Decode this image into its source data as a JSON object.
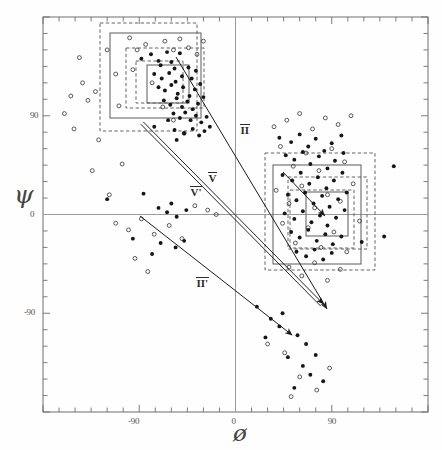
{
  "figure": {
    "kind": "scatter-plot"
  },
  "axes": {
    "x_symbol": "ø",
    "y_symbol": "ψ",
    "x_name": "phi",
    "y_name": "psi",
    "x_ticklabels": [
      "-90",
      "0",
      "90"
    ],
    "y_ticklabels": [
      "90",
      "0",
      "-90"
    ],
    "x_tickvalues": [
      -90,
      0,
      90
    ],
    "y_tickvalues": [
      90,
      0,
      -90
    ],
    "xlim": [
      -180,
      180
    ],
    "ylim": [
      -180,
      180
    ],
    "minor_tick_step": 15,
    "frame_color": "#6e6e6e",
    "zeroline_color": "#9a9a9a"
  },
  "annotations": [
    {
      "id": "label-II",
      "text": "II",
      "overbar": true,
      "x": 240,
      "y": 124
    },
    {
      "id": "label-IIp",
      "text": "II'",
      "overbar": true,
      "x": 196,
      "y": 277
    },
    {
      "id": "label-V",
      "text": "V",
      "overbar": true,
      "x": 208,
      "y": 172
    },
    {
      "id": "label-Vp",
      "text": "V'",
      "overbar": true,
      "x": 190,
      "y": 186
    }
  ],
  "arrows": [
    {
      "id": "arrow-double-upleft",
      "style": "double-line",
      "x1": 322,
      "y1": 305,
      "x2": 142,
      "y2": 123,
      "head": "start"
    },
    {
      "id": "arrow-II-down",
      "style": "single-line",
      "x1": 176,
      "y1": 57,
      "x2": 327,
      "y2": 309,
      "head": "end"
    },
    {
      "id": "arrow-IIp-upleft",
      "style": "single-line",
      "x1": 292,
      "y1": 335,
      "x2": 140,
      "y2": 216,
      "head": "start"
    },
    {
      "id": "arrow-cluster2-in",
      "style": "single-line",
      "x1": 283,
      "y1": 172,
      "x2": 325,
      "y2": 216,
      "head": "end"
    }
  ],
  "boxes": [
    {
      "id": "c1-outer-dashed",
      "cluster": 1,
      "line": "dashed",
      "x": 100,
      "y": 23,
      "w": 97,
      "h": 108
    },
    {
      "id": "c1-outer-solid",
      "cluster": 1,
      "line": "solid",
      "x": 110,
      "y": 33,
      "w": 91,
      "h": 85
    },
    {
      "id": "c1-mid-dashed",
      "cluster": 1,
      "line": "dashed",
      "x": 126,
      "y": 48,
      "w": 78,
      "h": 60
    },
    {
      "id": "c1-inner-dashed",
      "cluster": 1,
      "line": "dashed",
      "x": 136,
      "y": 61,
      "w": 47,
      "h": 42
    },
    {
      "id": "c1-inner-solid",
      "cluster": 1,
      "line": "solid",
      "x": 147,
      "y": 65,
      "w": 42,
      "h": 38
    },
    {
      "id": "c2-outer-dashed",
      "cluster": 2,
      "line": "dashed",
      "x": 265,
      "y": 153,
      "w": 110,
      "h": 117
    },
    {
      "id": "c2-outer-solid",
      "cluster": 2,
      "line": "solid",
      "x": 273,
      "y": 165,
      "w": 88,
      "h": 99
    },
    {
      "id": "c2-mid-dashed",
      "cluster": 2,
      "line": "dashed",
      "x": 288,
      "y": 177,
      "w": 79,
      "h": 72
    },
    {
      "id": "c2-inner-dashed",
      "cluster": 2,
      "line": "dashed",
      "x": 290,
      "y": 190,
      "w": 64,
      "h": 58
    },
    {
      "id": "c2-inner-solid",
      "cluster": 2,
      "line": "solid",
      "x": 306,
      "y": 192,
      "w": 42,
      "h": 44
    }
  ],
  "chart_data": {
    "type": "scatter",
    "title": "",
    "xlabel": "ø",
    "ylabel": "ψ",
    "xlim": [
      -180,
      180
    ],
    "ylim": [
      -180,
      180
    ],
    "grid": false,
    "legend": null,
    "series": [
      {
        "name": "filled",
        "marker": "filled-circle",
        "color": "#161616",
        "points": [
          [
            -88,
            142
          ],
          [
            -79,
            146
          ],
          [
            -72,
            140
          ],
          [
            -70,
            136
          ],
          [
            -64,
            148
          ],
          [
            -60,
            139
          ],
          [
            -57,
            133
          ],
          [
            -52,
            147
          ],
          [
            -76,
            128
          ],
          [
            -69,
            124
          ],
          [
            -62,
            129
          ],
          [
            -56,
            121
          ],
          [
            -50,
            126
          ],
          [
            -44,
            134
          ],
          [
            -41,
            124
          ],
          [
            -37,
            131
          ],
          [
            -72,
            116
          ],
          [
            -66,
            113
          ],
          [
            -60,
            118
          ],
          [
            -54,
            110
          ],
          [
            -49,
            116
          ],
          [
            -43,
            108
          ],
          [
            -38,
            114
          ],
          [
            -33,
            119
          ],
          [
            -67,
            104
          ],
          [
            -61,
            100
          ],
          [
            -55,
            106
          ],
          [
            -50,
            98
          ],
          [
            -45,
            103
          ],
          [
            -40,
            96
          ],
          [
            -35,
            101
          ],
          [
            -30,
            107
          ],
          [
            -58,
            92
          ],
          [
            -52,
            88
          ],
          [
            -47,
            93
          ],
          [
            -42,
            86
          ],
          [
            -37,
            90
          ],
          [
            -32,
            84
          ],
          [
            -27,
            89
          ],
          [
            -63,
            86
          ],
          [
            -76,
            80
          ],
          [
            -57,
            77
          ],
          [
            -48,
            74
          ],
          [
            -40,
            78
          ],
          [
            -34,
            72
          ],
          [
            -29,
            76
          ],
          [
            -24,
            80
          ],
          [
            -55,
            68
          ],
          [
            -120,
            14
          ],
          [
            -86,
            19
          ],
          [
            -72,
            6
          ],
          [
            -64,
            2
          ],
          [
            -60,
            10
          ],
          [
            -55,
            -2
          ],
          [
            -46,
            4
          ],
          [
            -96,
            -22
          ],
          [
            -70,
            -26
          ],
          [
            -56,
            -30
          ],
          [
            -48,
            -24
          ],
          [
            -78,
            -36
          ],
          [
            41,
            70
          ],
          [
            52,
            66
          ],
          [
            60,
            73
          ],
          [
            68,
            62
          ],
          [
            75,
            69
          ],
          [
            83,
            58
          ],
          [
            90,
            65
          ],
          [
            99,
            72
          ],
          [
            47,
            54
          ],
          [
            55,
            50
          ],
          [
            63,
            57
          ],
          [
            70,
            46
          ],
          [
            78,
            53
          ],
          [
            86,
            42
          ],
          [
            93,
            49
          ],
          [
            101,
            56
          ],
          [
            44,
            36
          ],
          [
            53,
            31
          ],
          [
            61,
            38
          ],
          [
            69,
            28
          ],
          [
            77,
            34
          ],
          [
            85,
            24
          ],
          [
            92,
            31
          ],
          [
            100,
            38
          ],
          [
            49,
            18
          ],
          [
            57,
            13
          ],
          [
            65,
            20
          ],
          [
            73,
            10
          ],
          [
            81,
            17
          ],
          [
            88,
            7
          ],
          [
            96,
            14
          ],
          [
            104,
            20
          ],
          [
            46,
            1
          ],
          [
            55,
            -4
          ],
          [
            63,
            3
          ],
          [
            71,
            -7
          ],
          [
            79,
            -1
          ],
          [
            86,
            -10
          ],
          [
            94,
            -3
          ],
          [
            102,
            4
          ],
          [
            52,
            -16
          ],
          [
            60,
            -21
          ],
          [
            68,
            -14
          ],
          [
            76,
            -24
          ],
          [
            84,
            -18
          ],
          [
            91,
            -27
          ],
          [
            99,
            -20
          ],
          [
            118,
            -25
          ],
          [
            57,
            -34
          ],
          [
            66,
            -38
          ],
          [
            74,
            -32
          ],
          [
            82,
            -41
          ],
          [
            90,
            -35
          ],
          [
            139,
            -20
          ],
          [
            148,
            44
          ],
          [
            20,
            -84
          ],
          [
            33,
            -95
          ],
          [
            41,
            -102
          ],
          [
            58,
            -110
          ],
          [
            66,
            -118
          ],
          [
            49,
            -130
          ],
          [
            63,
            -138
          ],
          [
            75,
            -128
          ],
          [
            28,
            -112
          ],
          [
            70,
            -146
          ],
          [
            82,
            -152
          ],
          [
            55,
            -158
          ],
          [
            44,
            -90
          ]
        ]
      },
      {
        "name": "open",
        "marker": "open-circle",
        "color": "#3d3d3d",
        "points": [
          [
            -146,
            143
          ],
          [
            -154,
            108
          ],
          [
            -138,
            104
          ],
          [
            -131,
            112
          ],
          [
            -120,
            150
          ],
          [
            -112,
            128
          ],
          [
            -109,
            99
          ],
          [
            -160,
            92
          ],
          [
            -151,
            78
          ],
          [
            -143,
            120
          ],
          [
            -128,
            68
          ],
          [
            -134,
            40
          ],
          [
            -118,
            18
          ],
          [
            -106,
            46
          ],
          [
            -99,
            161
          ],
          [
            -92,
            150
          ],
          [
            -96,
            132
          ],
          [
            -84,
            155
          ],
          [
            -78,
            120
          ],
          [
            -66,
            158
          ],
          [
            -58,
            150
          ],
          [
            -52,
            160
          ],
          [
            -44,
            152
          ],
          [
            -36,
            146
          ],
          [
            -30,
            158
          ],
          [
            -68,
            98
          ],
          [
            -58,
            86
          ],
          [
            -48,
            74
          ],
          [
            -112,
            -8
          ],
          [
            -100,
            -14
          ],
          [
            -88,
            -4
          ],
          [
            -76,
            -18
          ],
          [
            -62,
            -10
          ],
          [
            -50,
            -22
          ],
          [
            -38,
            8
          ],
          [
            -26,
            4
          ],
          [
            -18,
            0
          ],
          [
            -94,
            -40
          ],
          [
            -82,
            -52
          ],
          [
            36,
            80
          ],
          [
            48,
            86
          ],
          [
            60,
            92
          ],
          [
            72,
            78
          ],
          [
            84,
            88
          ],
          [
            96,
            82
          ],
          [
            108,
            90
          ],
          [
            42,
            62
          ],
          [
            54,
            44
          ],
          [
            66,
            56
          ],
          [
            78,
            40
          ],
          [
            90,
            60
          ],
          [
            102,
            48
          ],
          [
            38,
            22
          ],
          [
            50,
            10
          ],
          [
            62,
            26
          ],
          [
            74,
            6
          ],
          [
            86,
            18
          ],
          [
            98,
            12
          ],
          [
            110,
            28
          ],
          [
            44,
            -8
          ],
          [
            56,
            -26
          ],
          [
            68,
            -12
          ],
          [
            80,
            -30
          ],
          [
            92,
            -16
          ],
          [
            104,
            -34
          ],
          [
            116,
            -6
          ],
          [
            50,
            -48
          ],
          [
            62,
            -56
          ],
          [
            74,
            -44
          ],
          [
            86,
            -60
          ],
          [
            98,
            -50
          ],
          [
            30,
            -118
          ],
          [
            46,
            -126
          ],
          [
            60,
            -148
          ],
          [
            76,
            -160
          ],
          [
            88,
            -140
          ],
          [
            52,
            -166
          ]
        ]
      }
    ]
  }
}
